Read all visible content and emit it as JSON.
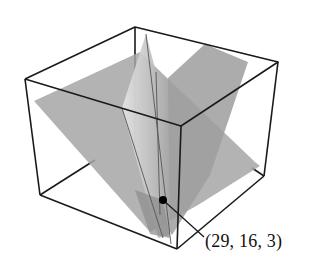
{
  "figure": {
    "type": "3d-planes-in-box",
    "intersection_point": {
      "label": "(29, 16, 3)",
      "coords": [
        29,
        16,
        3
      ]
    },
    "plane_count": 3,
    "colors": {
      "box_edges": "#1a1a1a",
      "plane_fill_dark": "#9a9a9a",
      "plane_fill_light": "#c4c4c4",
      "point": "#000000"
    }
  }
}
